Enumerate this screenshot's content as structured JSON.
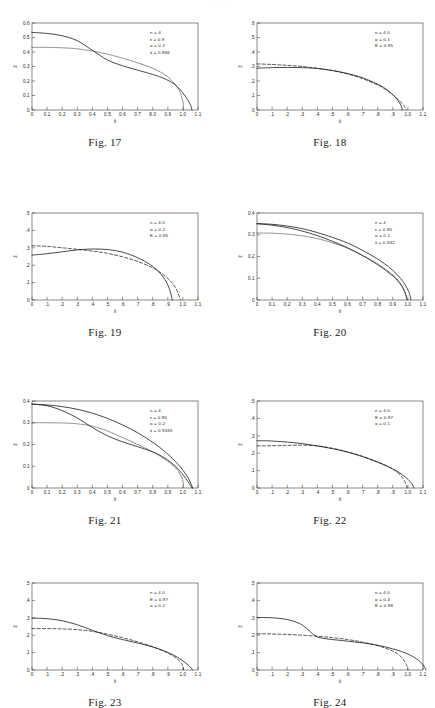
{
  "page": {
    "running_head": "·  ·  ·",
    "background": "#ffffff",
    "ink": "#15140f"
  },
  "figures": [
    {
      "id": "fig17",
      "caption": "Fig. 17",
      "chart_data": {
        "type": "line",
        "title": "Fig. 17",
        "xlabel": "x̄",
        "ylabel": "z̄",
        "xlim": [
          0,
          1.1
        ],
        "ylim": [
          0,
          0.6
        ],
        "xticks": [
          "0",
          "0.1",
          "0.2",
          "0.3",
          "0.4",
          "0.5",
          "0.6",
          "0.7",
          "8.0",
          "0.9",
          "1.0",
          "1.1"
        ],
        "yticks": [
          "0",
          "0.1",
          "0.2",
          "0.3",
          "0.4",
          "0.5",
          "0.6"
        ],
        "grid": false,
        "legend_position": "top-right",
        "annotations": [
          "n = 4",
          "ε = 0.9",
          "α = 0.2",
          "x̄ = 0.866"
        ],
        "series": [
          {
            "name": "solid",
            "style": "solid",
            "x": [
              0,
              0.1,
              0.2,
              0.3,
              0.4,
              0.5,
              0.6,
              0.7,
              0.8,
              0.85,
              0.9,
              0.95,
              1.0,
              1.03,
              1.05,
              1.06
            ],
            "y": [
              0.535,
              0.528,
              0.512,
              0.478,
              0.412,
              0.345,
              0.305,
              0.275,
              0.245,
              0.228,
              0.205,
              0.173,
              0.118,
              0.072,
              0.035,
              0.0
            ]
          },
          {
            "name": "dotted",
            "style": "dotted",
            "x": [
              0,
              0.1,
              0.2,
              0.3,
              0.4,
              0.5,
              0.6,
              0.7,
              0.8,
              0.85,
              0.9,
              0.95,
              0.98,
              1.0,
              1.005
            ],
            "y": [
              0.432,
              0.432,
              0.429,
              0.422,
              0.406,
              0.385,
              0.358,
              0.325,
              0.288,
              0.262,
              0.228,
              0.175,
              0.125,
              0.055,
              0.0
            ]
          }
        ]
      }
    },
    {
      "id": "fig18",
      "caption": "Fig. 18",
      "chart_data": {
        "type": "line",
        "title": "Fig. 18",
        "xlabel": "x̄",
        "ylabel": "z̄",
        "xlim": [
          0,
          1.1
        ],
        "ylim": [
          0,
          0.6
        ],
        "xticks": [
          "0",
          ".1",
          ".2",
          ".3",
          ".4",
          ".5",
          ".6",
          ".7",
          ".8",
          ".9",
          "1.0",
          "1.1"
        ],
        "yticks": [
          "0",
          ".1",
          ".2",
          ".3",
          ".4",
          ".5",
          ".6"
        ],
        "grid": false,
        "legend_position": "top-right",
        "annotations": [
          "n = 4.0",
          "α = 0.1",
          "E = 0.95"
        ],
        "series": [
          {
            "name": "solid",
            "style": "solid",
            "x": [
              0,
              0.1,
              0.2,
              0.3,
              0.4,
              0.5,
              0.6,
              0.7,
              0.8,
              0.85,
              0.9,
              0.93,
              0.955,
              0.962
            ],
            "y": [
              0.288,
              0.292,
              0.294,
              0.292,
              0.286,
              0.272,
              0.252,
              0.222,
              0.178,
              0.148,
              0.105,
              0.072,
              0.03,
              0.0
            ]
          },
          {
            "name": "dashed",
            "style": "dashed",
            "x": [
              0,
              0.1,
              0.2,
              0.3,
              0.4,
              0.5,
              0.6,
              0.7,
              0.8,
              0.85,
              0.9,
              0.94,
              0.975,
              0.99
            ],
            "y": [
              0.318,
              0.314,
              0.308,
              0.3,
              0.288,
              0.272,
              0.248,
              0.216,
              0.172,
              0.143,
              0.104,
              0.068,
              0.028,
              0.0
            ]
          }
        ]
      }
    },
    {
      "id": "fig19",
      "caption": "Fig. 19",
      "chart_data": {
        "type": "line",
        "title": "Fig. 19",
        "xlabel": "x̄",
        "ylabel": "z̄",
        "xlim": [
          0,
          1.1
        ],
        "ylim": [
          0,
          0.5
        ],
        "xticks": [
          "0",
          ".1",
          ".2",
          ".3",
          ".4",
          ".5",
          ".6",
          ".7",
          ".8",
          ".9",
          "1.0",
          "1.1"
        ],
        "yticks": [
          "0",
          ".1",
          ".2",
          ".3",
          ".4",
          ".5"
        ],
        "grid": false,
        "legend_position": "top-right",
        "annotations": [
          "n = 4.0",
          "α = 0.2",
          "E = 0.95"
        ],
        "series": [
          {
            "name": "solid",
            "style": "solid",
            "x": [
              0,
              0.1,
              0.2,
              0.3,
              0.4,
              0.5,
              0.6,
              0.7,
              0.78,
              0.84,
              0.88,
              0.91,
              0.93
            ],
            "y": [
              0.258,
              0.266,
              0.277,
              0.288,
              0.293,
              0.29,
              0.275,
              0.243,
              0.205,
              0.162,
              0.118,
              0.066,
              0.0
            ]
          },
          {
            "name": "dashed",
            "style": "dashed",
            "x": [
              0,
              0.1,
              0.2,
              0.3,
              0.4,
              0.5,
              0.6,
              0.7,
              0.8,
              0.86,
              0.91,
              0.95,
              0.985
            ],
            "y": [
              0.312,
              0.308,
              0.3,
              0.291,
              0.281,
              0.268,
              0.248,
              0.222,
              0.185,
              0.152,
              0.115,
              0.072,
              0.0
            ]
          }
        ]
      }
    },
    {
      "id": "fig20",
      "caption": "Fig. 20",
      "chart_data": {
        "type": "line",
        "title": "Fig. 20",
        "xlabel": "x̄",
        "ylabel": "z̄",
        "xlim": [
          0,
          1.1
        ],
        "ylim": [
          0,
          0.4
        ],
        "xticks": [
          "0",
          "0.1",
          "0.2",
          "0.3",
          "0.4",
          "0.5",
          "0.6",
          "0.7",
          "0.8",
          "0.9",
          "1.0",
          "1.1"
        ],
        "yticks": [
          "0",
          "0.1",
          "0.2",
          "0.3",
          "0.4"
        ],
        "grid": false,
        "legend_position": "top-right",
        "annotations": [
          "n = 4",
          "ε = 0.95",
          "α = 0.1",
          "x̄ = 0.942"
        ],
        "series": [
          {
            "name": "solid",
            "style": "solid",
            "x": [
              0,
              0.1,
              0.2,
              0.3,
              0.4,
              0.5,
              0.6,
              0.7,
              0.8,
              0.88,
              0.94,
              0.98,
              1.01,
              1.02
            ],
            "y": [
              0.352,
              0.348,
              0.34,
              0.328,
              0.31,
              0.288,
              0.262,
              0.228,
              0.188,
              0.148,
              0.108,
              0.072,
              0.03,
              0.0
            ]
          },
          {
            "name": "solid-2",
            "style": "solid",
            "x": [
              0,
              0.1,
              0.2,
              0.3,
              0.4,
              0.5,
              0.6,
              0.7,
              0.8,
              0.88,
              0.93,
              0.965,
              0.985,
              0.995
            ],
            "y": [
              0.35,
              0.344,
              0.333,
              0.317,
              0.296,
              0.27,
              0.24,
              0.204,
              0.162,
              0.122,
              0.09,
              0.058,
              0.026,
              0.0
            ]
          },
          {
            "name": "dotted",
            "style": "dotted",
            "x": [
              0,
              0.1,
              0.2,
              0.3,
              0.4,
              0.5,
              0.6,
              0.7,
              0.8,
              0.88,
              0.93,
              0.965,
              0.985,
              0.993
            ],
            "y": [
              0.308,
              0.307,
              0.303,
              0.295,
              0.282,
              0.263,
              0.238,
              0.205,
              0.166,
              0.126,
              0.094,
              0.06,
              0.027,
              0.0
            ]
          }
        ]
      }
    },
    {
      "id": "fig21",
      "caption": "Fig. 21",
      "chart_data": {
        "type": "line",
        "title": "Fig. 21",
        "xlabel": "x̄",
        "ylabel": "z̄",
        "xlim": [
          0,
          1.1
        ],
        "ylim": [
          0,
          0.4
        ],
        "xticks": [
          "0",
          "0.1",
          "0.2",
          "0.3",
          "0.4",
          "0.5",
          "0.6",
          "0.7",
          "0.8",
          "0.9",
          "1.0",
          "1.1"
        ],
        "yticks": [
          "0",
          "0.1",
          "0.2",
          "0.3",
          "0.4"
        ],
        "grid": false,
        "legend_position": "top-right",
        "annotations": [
          "n = 4",
          "ε = 0.95",
          "α = 0.2",
          "x̄ = 0.9335"
        ],
        "series": [
          {
            "name": "solid-upper",
            "style": "solid",
            "x": [
              0,
              0.1,
              0.2,
              0.3,
              0.4,
              0.5,
              0.6,
              0.7,
              0.8,
              0.88,
              0.95,
              1.0,
              1.04,
              1.065
            ],
            "y": [
              0.385,
              0.382,
              0.374,
              0.362,
              0.344,
              0.32,
              0.29,
              0.254,
              0.21,
              0.168,
              0.122,
              0.082,
              0.04,
              0.0
            ]
          },
          {
            "name": "solid-lower",
            "style": "solid",
            "x": [
              0,
              0.1,
              0.2,
              0.3,
              0.4,
              0.5,
              0.6,
              0.7,
              0.8,
              0.88,
              0.95,
              1.0,
              1.035,
              1.06
            ],
            "y": [
              0.386,
              0.378,
              0.356,
              0.322,
              0.278,
              0.24,
              0.212,
              0.19,
              0.166,
              0.138,
              0.1,
              0.062,
              0.028,
              0.0
            ]
          },
          {
            "name": "dotted",
            "style": "dotted",
            "x": [
              0,
              0.1,
              0.2,
              0.3,
              0.4,
              0.5,
              0.6,
              0.7,
              0.8,
              0.88,
              0.94,
              0.98,
              1.0,
              1.005
            ],
            "y": [
              0.3,
              0.3,
              0.299,
              0.295,
              0.284,
              0.262,
              0.232,
              0.2,
              0.166,
              0.132,
              0.1,
              0.066,
              0.032,
              0.0
            ]
          }
        ]
      }
    },
    {
      "id": "fig22",
      "caption": "Fig. 22",
      "chart_data": {
        "type": "line",
        "title": "Fig. 22",
        "xlabel": "x̄",
        "ylabel": "z̄",
        "xlim": [
          0,
          1.1
        ],
        "ylim": [
          0,
          0.5
        ],
        "xticks": [
          "0",
          ".1",
          ".2",
          ".3",
          ".4",
          ".5",
          ".6",
          ".7",
          ".8",
          ".9",
          "1.0",
          "1.1"
        ],
        "yticks": [
          "0",
          ".1",
          ".2",
          ".3",
          ".4",
          ".5"
        ],
        "grid": false,
        "legend_position": "top-right",
        "annotations": [
          "n = 4.0",
          "E = 0.97",
          "α = 0.1"
        ],
        "series": [
          {
            "name": "solid",
            "style": "solid",
            "x": [
              0,
              0.1,
              0.2,
              0.3,
              0.4,
              0.5,
              0.6,
              0.7,
              0.8,
              0.88,
              0.94,
              0.99,
              1.025,
              1.04
            ],
            "y": [
              0.272,
              0.27,
              0.264,
              0.255,
              0.242,
              0.226,
              0.206,
              0.18,
              0.148,
              0.118,
              0.09,
              0.058,
              0.026,
              0.0
            ]
          },
          {
            "name": "dashed",
            "style": "dashed",
            "x": [
              0,
              0.1,
              0.2,
              0.3,
              0.4,
              0.5,
              0.6,
              0.7,
              0.8,
              0.88,
              0.93,
              0.965,
              0.985,
              0.995
            ],
            "y": [
              0.242,
              0.243,
              0.245,
              0.246,
              0.242,
              0.228,
              0.208,
              0.182,
              0.15,
              0.118,
              0.09,
              0.058,
              0.026,
              0.0
            ]
          }
        ]
      }
    },
    {
      "id": "fig23",
      "caption": "Fig. 23",
      "chart_data": {
        "type": "line",
        "title": "Fig. 23",
        "xlabel": "x̄",
        "ylabel": "z̄",
        "xlim": [
          0,
          1.1
        ],
        "ylim": [
          0,
          0.5
        ],
        "xticks": [
          "0",
          ".1",
          ".2",
          ".3",
          ".4",
          ".5",
          ".6",
          ".7",
          ".8",
          ".9",
          "1.0",
          "1.1"
        ],
        "yticks": [
          "0",
          ".1",
          ".2",
          ".3",
          ".4",
          ".5"
        ],
        "grid": false,
        "legend_position": "top-right",
        "annotations": [
          "n = 4.0",
          "E = 0.97",
          "α = 0.2"
        ],
        "series": [
          {
            "name": "solid",
            "style": "solid",
            "x": [
              0,
              0.1,
              0.2,
              0.3,
              0.4,
              0.5,
              0.6,
              0.7,
              0.8,
              0.88,
              0.95,
              1.0,
              1.04,
              1.065
            ],
            "y": [
              0.298,
              0.295,
              0.283,
              0.26,
              0.228,
              0.198,
              0.175,
              0.155,
              0.132,
              0.108,
              0.08,
              0.052,
              0.025,
              0.0
            ]
          },
          {
            "name": "dashed",
            "style": "dashed",
            "x": [
              0,
              0.1,
              0.2,
              0.3,
              0.4,
              0.5,
              0.6,
              0.7,
              0.8,
              0.88,
              0.94,
              0.98,
              1.0,
              1.005
            ],
            "y": [
              0.238,
              0.238,
              0.236,
              0.232,
              0.222,
              0.206,
              0.186,
              0.162,
              0.134,
              0.106,
              0.078,
              0.05,
              0.024,
              0.0
            ]
          }
        ]
      }
    },
    {
      "id": "fig24",
      "caption": "Fig. 24",
      "chart_data": {
        "type": "line",
        "title": "Fig. 24",
        "xlabel": "x̄",
        "ylabel": "z̄",
        "xlim": [
          0,
          1.1
        ],
        "ylim": [
          0,
          0.5
        ],
        "xticks": [
          "0",
          ".1",
          ".2",
          ".3",
          ".4",
          ".5",
          ".6",
          ".7",
          ".8",
          ".9",
          "1.0",
          "1.1"
        ],
        "yticks": [
          "0",
          ".1",
          ".2",
          ".3",
          ".4",
          ".5"
        ],
        "grid": false,
        "legend_position": "top-right",
        "annotations": [
          "n = 4.0",
          "α = 0.4",
          "E = 0.98"
        ],
        "series": [
          {
            "name": "solid",
            "style": "solid",
            "x": [
              0,
              0.1,
              0.2,
              0.28,
              0.33,
              0.38,
              0.42,
              0.5,
              0.6,
              0.7,
              0.8,
              0.88,
              0.95,
              1.0,
              1.06,
              1.1,
              1.12
            ],
            "y": [
              0.302,
              0.3,
              0.29,
              0.268,
              0.238,
              0.2,
              0.185,
              0.175,
              0.166,
              0.156,
              0.142,
              0.126,
              0.108,
              0.092,
              0.062,
              0.03,
              0.0
            ]
          },
          {
            "name": "dashed",
            "style": "dashed",
            "x": [
              0,
              0.1,
              0.2,
              0.3,
              0.4,
              0.5,
              0.6,
              0.7,
              0.8,
              0.88,
              0.93,
              0.965,
              0.99,
              1.0
            ],
            "y": [
              0.208,
              0.207,
              0.204,
              0.2,
              0.194,
              0.186,
              0.175,
              0.16,
              0.14,
              0.116,
              0.094,
              0.066,
              0.03,
              0.0
            ]
          }
        ]
      }
    }
  ]
}
